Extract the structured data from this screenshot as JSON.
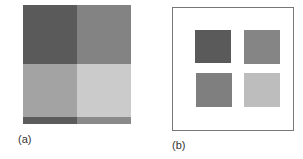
{
  "panels": [
    {
      "label": "(a)",
      "quadrants": {
        "top_left": "#5a5a5a",
        "top_right": "#838383",
        "bottom_left": "#808080",
        "bottom_right": "#b8b8b8"
      },
      "bottom_strip": {
        "left": "#5c5c5c",
        "right": "#8a8a8a"
      },
      "overlay_band": "rgba(255,255,255,0.28)"
    },
    {
      "label": "(b)",
      "squares": {
        "top_left": "#5a5a5a",
        "top_right": "#858585",
        "bottom_left": "#7f7f7f",
        "bottom_right": "#bdbdbd"
      }
    }
  ]
}
